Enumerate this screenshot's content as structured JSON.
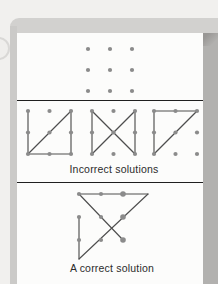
{
  "figure_title": "Nine-dot puzzle",
  "labels": {
    "incorrect": "Incorrect solutions",
    "correct": "A correct solution"
  },
  "colors": {
    "page_bg": "#f1f0ee",
    "frame_top": "#d2d1cf",
    "frame_left": "#cbcac8",
    "frame_right": "#b2b1af",
    "corner_shadow": "#999795",
    "panel_bg": "#fcfcfb",
    "divider": "#1f1f1f",
    "dot": "#8b8b8b",
    "line": "#4e4e4e",
    "text": "#2b2b2b",
    "ring_border": "#d9d8d6",
    "ring_fill": "#efeeec"
  },
  "render": {
    "dot_radius": 2.1,
    "line_width": 1.15
  },
  "diagrams": {
    "puzzle": {
      "description": "3x3 grid of dots, no lines",
      "dots": [
        [
          71,
          16
        ],
        [
          93,
          16
        ],
        [
          115,
          16
        ],
        [
          71,
          37
        ],
        [
          93,
          37
        ],
        [
          115,
          37
        ],
        [
          71,
          58
        ],
        [
          93,
          58
        ],
        [
          115,
          58
        ]
      ],
      "lines": []
    },
    "incorrect": {
      "description": "three failed four-line attempts",
      "figures": [
        {
          "name": "square-with-diagonal-misses-top-middle",
          "dots": [
            [
              11,
              11
            ],
            [
              32.5,
              11
            ],
            [
              54,
              11
            ],
            [
              11,
              32.5
            ],
            [
              32.5,
              32.5
            ],
            [
              54,
              32.5
            ],
            [
              11,
              54
            ],
            [
              32.5,
              54
            ],
            [
              54,
              54
            ]
          ],
          "lines": [
            [
              11,
              11,
              11,
              54
            ],
            [
              11,
              54,
              54,
              11
            ],
            [
              54,
              11,
              54,
              54
            ],
            [
              11,
              54,
              54,
              54
            ]
          ]
        },
        {
          "name": "bowtie-misses-top-and-bottom-middle",
          "dots": [
            [
              75,
              11
            ],
            [
              96.5,
              11
            ],
            [
              118,
              11
            ],
            [
              75,
              32.5
            ],
            [
              96.5,
              32.5
            ],
            [
              118,
              32.5
            ],
            [
              75,
              54
            ],
            [
              96.5,
              54
            ],
            [
              118,
              54
            ]
          ],
          "lines": [
            [
              75,
              11,
              75,
              54
            ],
            [
              75,
              11,
              118,
              54
            ],
            [
              75,
              54,
              118,
              11
            ],
            [
              118,
              11,
              118,
              54
            ]
          ]
        },
        {
          "name": "triangle-misses-right-and-bottom",
          "dots": [
            [
              137,
              11
            ],
            [
              158.5,
              11
            ],
            [
              180,
              11
            ],
            [
              137,
              32.5
            ],
            [
              158.5,
              32.5
            ],
            [
              180,
              32.5
            ],
            [
              137,
              54
            ],
            [
              158.5,
              54
            ],
            [
              180,
              54
            ]
          ],
          "lines": [
            [
              137,
              11,
              180,
              11
            ],
            [
              137,
              11,
              137,
              54
            ],
            [
              137,
              54,
              180,
              11
            ]
          ]
        }
      ]
    },
    "correct": {
      "description": "four connected lines extending beyond the grid",
      "dots": [
        [
          62,
          11
        ],
        [
          84,
          11
        ],
        [
          106,
          11,
          2.8
        ],
        [
          62,
          34
        ],
        [
          84,
          34
        ],
        [
          106,
          34,
          2.8
        ],
        [
          62,
          57
        ],
        [
          84,
          57
        ],
        [
          106,
          57,
          2.8
        ]
      ],
      "lines": [
        [
          62,
          34,
          62,
          76
        ],
        [
          62,
          76,
          131,
          11
        ],
        [
          131,
          11,
          62,
          11
        ],
        [
          62,
          11,
          106,
          57
        ]
      ]
    }
  }
}
